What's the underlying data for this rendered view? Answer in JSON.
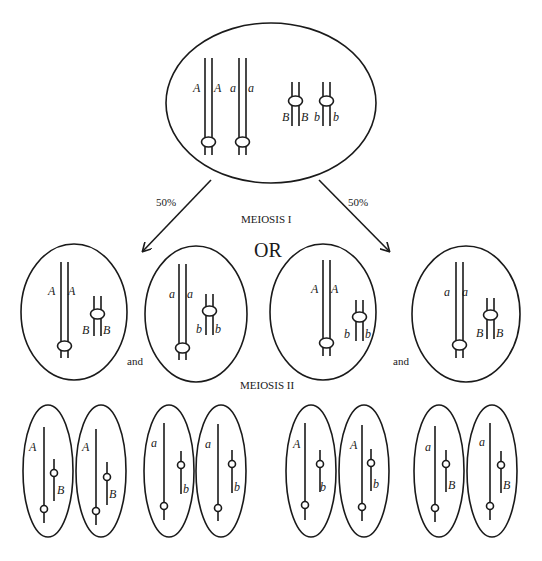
{
  "labels": {
    "meiosis1": "MEIOSIS I",
    "meiosis2": "MEIOSIS II",
    "or": "OR",
    "and": "and",
    "pct_left": "50%",
    "pct_right": "50%"
  },
  "parent_cell": {
    "alleles": [
      "A",
      "A",
      "a",
      "a",
      "B",
      "B",
      "b",
      "b"
    ]
  },
  "meiosis1_cells": [
    {
      "long": [
        "A",
        "A"
      ],
      "short": [
        "B",
        "B"
      ]
    },
    {
      "long": [
        "a",
        "a"
      ],
      "short": [
        "b",
        "b"
      ]
    },
    {
      "long": [
        "A",
        "A"
      ],
      "short": [
        "b",
        "b"
      ]
    },
    {
      "long": [
        "a",
        "a"
      ],
      "short": [
        "B",
        "B"
      ]
    }
  ],
  "meiosis2_cells": [
    {
      "long": "A",
      "short": "B"
    },
    {
      "long": "A",
      "short": "B"
    },
    {
      "long": "a",
      "short": "b"
    },
    {
      "long": "a",
      "short": "b"
    },
    {
      "long": "A",
      "short": "b"
    },
    {
      "long": "A",
      "short": "b"
    },
    {
      "long": "a",
      "short": "B"
    },
    {
      "long": "a",
      "short": "B"
    }
  ]
}
